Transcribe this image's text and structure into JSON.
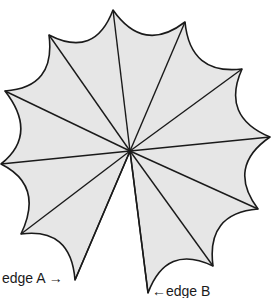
{
  "diagram": {
    "type": "cut-cone-net",
    "fill_color": "#e6e6e6",
    "line_color": "#1a1a1a",
    "center": [
      130,
      151
    ],
    "vertices": [
      [
        113,
        10
      ],
      [
        185,
        22
      ],
      [
        242,
        69
      ],
      [
        270,
        137
      ],
      [
        258,
        209
      ],
      [
        213,
        266
      ],
      [
        148,
        293
      ],
      [
        75,
        280
      ],
      [
        21,
        234
      ],
      [
        1,
        164
      ],
      [
        5,
        91
      ],
      [
        49,
        35
      ]
    ],
    "open_gap_between": [
      6,
      7
    ]
  },
  "labels": {
    "edge_a": "edge A →",
    "edge_b": "←edge B"
  }
}
